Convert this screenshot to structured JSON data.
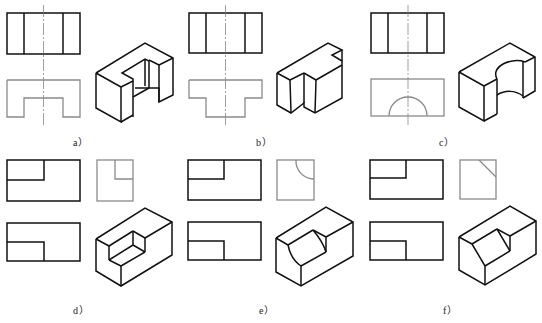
{
  "figure": {
    "panels": [
      {
        "id": "a",
        "label": "a）",
        "description": "U-shaped block: front view with two vertical lines, top view with rectangular notch, isometric view"
      },
      {
        "id": "b",
        "label": "b）",
        "description": "T-shaped block: front view with two vertical lines, top view T profile, isometric view"
      },
      {
        "id": "c",
        "label": "c）",
        "description": "Block with semicircular cut: front view, top view with semicircle, isometric view"
      },
      {
        "id": "d",
        "label": "d）",
        "description": "Block with rectangular corner notch: front view, side view, top view, isometric view"
      },
      {
        "id": "e",
        "label": "e）",
        "description": "Block with quarter-round notch: front view, side view with arc, top view, isometric view"
      },
      {
        "id": "f",
        "label": "f）",
        "description": "Block with chamfered notch: front view, side view with diagonal, top view, isometric view"
      }
    ]
  }
}
